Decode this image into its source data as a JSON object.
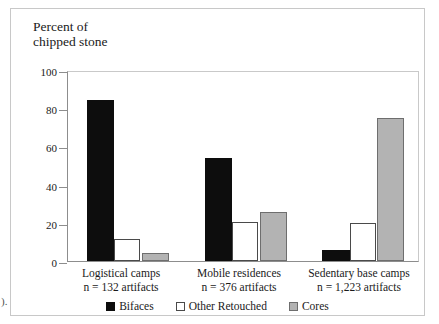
{
  "page": {
    "top_caption": "",
    "left_margin_fragment": ")."
  },
  "chart_data": {
    "type": "bar",
    "title": "Percent of\nchipped stone",
    "xlabel": "",
    "ylabel": "Percent of chipped stone",
    "ylim": [
      0,
      100
    ],
    "yticks": [
      0,
      20,
      40,
      60,
      80,
      100
    ],
    "grid": false,
    "legend_position": "bottom",
    "categories": [
      "Logistical camps\nn = 132 artifacts",
      "Mobile residences\nn = 376 artifacts",
      "Sedentary base camps\nn = 1,223 artifacts"
    ],
    "category_names": [
      "Logistical camps",
      "Mobile residences",
      "Sedentary base camps"
    ],
    "category_counts": [
      "n = 132 artifacts",
      "n = 376 artifacts",
      "n = 1,223 artifacts"
    ],
    "series": [
      {
        "name": "Bifaces",
        "color": "#0d0d0d",
        "values": [
          85,
          54.5,
          6
        ]
      },
      {
        "name": "Other Retouched",
        "color": "#ffffff",
        "values": [
          11.5,
          20.5,
          20
        ]
      },
      {
        "name": "Cores",
        "color": "#b3b3b3",
        "values": [
          4,
          26,
          75.5
        ]
      }
    ]
  }
}
